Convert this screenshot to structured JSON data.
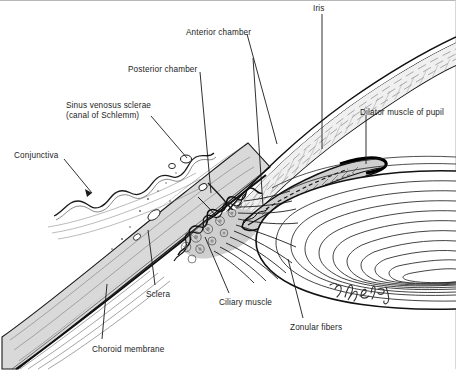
{
  "figure": {
    "artist_signature": "D. Abel",
    "background_color": "#ffffff",
    "line_color": "#1a1a1a",
    "tissue_fill_color": "#d9d9d9",
    "border_color": "#b8b8b8"
  },
  "labels": [
    {
      "id": "iris",
      "text": "Iris",
      "x": 313,
      "y": 3,
      "align": "left"
    },
    {
      "id": "anterior",
      "text": "Anterior chamber",
      "x": 186,
      "y": 27,
      "align": "left"
    },
    {
      "id": "posterior",
      "text": "Posterior chamber",
      "x": 128,
      "y": 64,
      "align": "left"
    },
    {
      "id": "sinus",
      "text": "Sinus venosus sclerae",
      "line2": "(canal of Schlemm)",
      "x": 66,
      "y": 100,
      "align": "left"
    },
    {
      "id": "dilator",
      "text": "Dilator muscle of pupil",
      "x": 360,
      "y": 107,
      "align": "left"
    },
    {
      "id": "conjunctiva",
      "text": "Conjunctiva",
      "x": 14,
      "y": 150,
      "align": "left"
    },
    {
      "id": "sclera",
      "text": "Sclera",
      "x": 146,
      "y": 289,
      "align": "left"
    },
    {
      "id": "ciliary",
      "text": "Ciliary muscle",
      "x": 219,
      "y": 297,
      "align": "left"
    },
    {
      "id": "zonular",
      "text": "Zonular fibers",
      "x": 290,
      "y": 322,
      "align": "left"
    },
    {
      "id": "choroid",
      "text": "Choroid membrane",
      "x": 92,
      "y": 344,
      "align": "left"
    }
  ],
  "structures": [
    {
      "id": "cornea",
      "name": "Cornea"
    },
    {
      "id": "sclera-body",
      "name": "Sclera"
    },
    {
      "id": "conjunctiva-membrane",
      "name": "Conjunctiva"
    },
    {
      "id": "iris-body",
      "name": "Iris"
    },
    {
      "id": "lens",
      "name": "Lens"
    },
    {
      "id": "ciliary-body",
      "name": "Ciliary body and processes"
    },
    {
      "id": "zonular-fibers",
      "name": "Zonular fibers"
    },
    {
      "id": "choroid-layer",
      "name": "Choroid membrane"
    },
    {
      "id": "schlemm-canal",
      "name": "Sinus venosus sclerae"
    }
  ]
}
